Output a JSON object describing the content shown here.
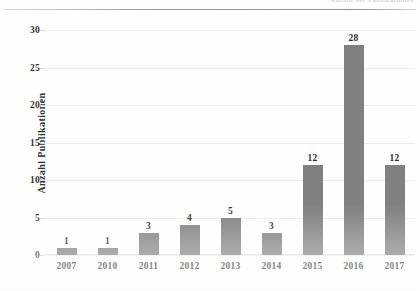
{
  "header": {
    "cut_off_text": "Anzahl der Publikationen",
    "visible": true
  },
  "chart_data": {
    "type": "bar",
    "title": "",
    "xlabel": "",
    "ylabel": "Anzahl  Publikationen",
    "categories": [
      "2007",
      "2010",
      "2011",
      "2012",
      "2013",
      "2014",
      "2015",
      "2016",
      "2017"
    ],
    "values": [
      1,
      1,
      3,
      4,
      5,
      3,
      12,
      28,
      12
    ],
    "data_labels": [
      "1",
      "1",
      "3",
      "4",
      "5",
      "3",
      "12",
      "28",
      "12"
    ],
    "ylim": [
      0,
      30
    ],
    "ytick_values": [
      0,
      5,
      10,
      15,
      20,
      25,
      30
    ],
    "ytick_labels": [
      "0",
      "5",
      "10",
      "15",
      "20",
      "25",
      "30"
    ],
    "grid": true,
    "grid_axis": "y",
    "legend": false,
    "legend_position": "none",
    "bar_color": "#808080",
    "grid_color": "#ededed",
    "text_color": "#2e2e2e",
    "background": "#ffffff"
  }
}
